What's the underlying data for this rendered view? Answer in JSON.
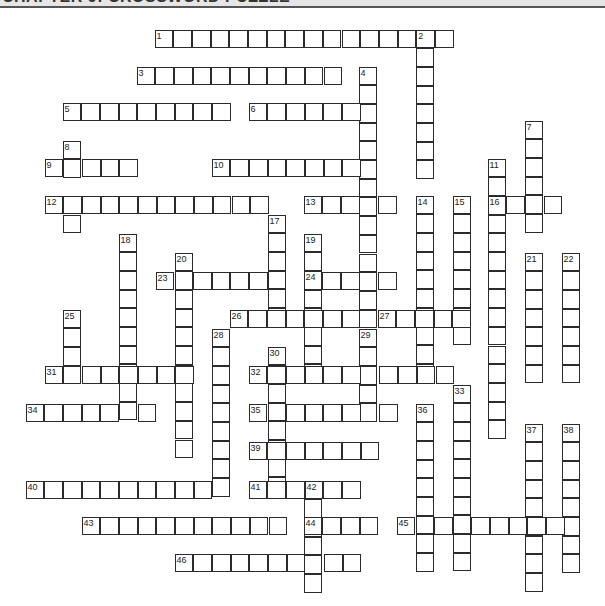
{
  "header": {
    "title": "CHAPTER 9: CROSSWORD PUZZLE"
  },
  "cell_size": 18.7,
  "words": [
    {
      "num": "1",
      "dir": "across",
      "x": 155,
      "y": 30,
      "len": 16
    },
    {
      "num": "2",
      "dir": "down",
      "x": 416,
      "y": 30,
      "len": 8
    },
    {
      "num": "3",
      "dir": "across",
      "x": 137,
      "y": 67,
      "len": 11
    },
    {
      "num": "4",
      "dir": "down",
      "x": 359,
      "y": 67,
      "len": 14
    },
    {
      "num": "5",
      "dir": "across",
      "x": 63,
      "y": 103,
      "len": 9
    },
    {
      "num": "6",
      "dir": "across",
      "x": 249,
      "y": 103,
      "len": 7
    },
    {
      "num": "7",
      "dir": "down",
      "x": 525,
      "y": 121,
      "len": 6
    },
    {
      "num": "8",
      "dir": "down",
      "x": 63,
      "y": 141,
      "len": 2
    },
    {
      "num": "9",
      "dir": "across",
      "x": 45,
      "y": 159,
      "len": 5
    },
    {
      "num": "10",
      "dir": "across",
      "x": 212,
      "y": 159,
      "len": 9
    },
    {
      "num": "11",
      "dir": "down",
      "x": 488,
      "y": 159,
      "len": 15
    },
    {
      "num": "12",
      "dir": "across",
      "x": 45,
      "y": 196,
      "len": 12
    },
    {
      "num": "",
      "dir": "down",
      "x": 63,
      "y": 215,
      "len": 1
    },
    {
      "num": "13",
      "dir": "across",
      "x": 304,
      "y": 196,
      "len": 5
    },
    {
      "num": "14",
      "dir": "down",
      "x": 416,
      "y": 196,
      "len": 10
    },
    {
      "num": "15",
      "dir": "down",
      "x": 453,
      "y": 196,
      "len": 8
    },
    {
      "num": "16",
      "dir": "across",
      "x": 488,
      "y": 196,
      "len": 4
    },
    {
      "num": "17",
      "dir": "down",
      "x": 268,
      "y": 215,
      "len": 6
    },
    {
      "num": "18",
      "dir": "down",
      "x": 119,
      "y": 234,
      "len": 10
    },
    {
      "num": "19",
      "dir": "down",
      "x": 304,
      "y": 234,
      "len": 8
    },
    {
      "num": "20",
      "dir": "down",
      "x": 175,
      "y": 253,
      "len": 11
    },
    {
      "num": "21",
      "dir": "down",
      "x": 525,
      "y": 253,
      "len": 7
    },
    {
      "num": "22",
      "dir": "down",
      "x": 562,
      "y": 253,
      "len": 7
    },
    {
      "num": "23",
      "dir": "across",
      "x": 156,
      "y": 272,
      "len": 7
    },
    {
      "num": "24",
      "dir": "across",
      "x": 304,
      "y": 272,
      "len": 5
    },
    {
      "num": "25",
      "dir": "down",
      "x": 63,
      "y": 310,
      "len": 4
    },
    {
      "num": "26",
      "dir": "across",
      "x": 230,
      "y": 310,
      "len": 7
    },
    {
      "num": "27",
      "dir": "across",
      "x": 378,
      "y": 310,
      "len": 5
    },
    {
      "num": "28",
      "dir": "down",
      "x": 212,
      "y": 329,
      "len": 9
    },
    {
      "num": "29",
      "dir": "down",
      "x": 359,
      "y": 329,
      "len": 5
    },
    {
      "num": "30",
      "dir": "down",
      "x": 268,
      "y": 347,
      "len": 8
    },
    {
      "num": "31",
      "dir": "across",
      "x": 45,
      "y": 366,
      "len": 8
    },
    {
      "num": "32",
      "dir": "across",
      "x": 249,
      "y": 366,
      "len": 11
    },
    {
      "num": "33",
      "dir": "down",
      "x": 453,
      "y": 385,
      "len": 10
    },
    {
      "num": "34",
      "dir": "across",
      "x": 26,
      "y": 404,
      "len": 7
    },
    {
      "num": "35",
      "dir": "across",
      "x": 249,
      "y": 404,
      "len": 8
    },
    {
      "num": "36",
      "dir": "down",
      "x": 416,
      "y": 404,
      "len": 9
    },
    {
      "num": "37",
      "dir": "down",
      "x": 525,
      "y": 424,
      "len": 9
    },
    {
      "num": "38",
      "dir": "down",
      "x": 562,
      "y": 424,
      "len": 8
    },
    {
      "num": "39",
      "dir": "across",
      "x": 249,
      "y": 442,
      "len": 7
    },
    {
      "num": "40",
      "dir": "across",
      "x": 26,
      "y": 481,
      "len": 11
    },
    {
      "num": "41",
      "dir": "across",
      "x": 249,
      "y": 481,
      "len": 6
    },
    {
      "num": "42",
      "dir": "down",
      "x": 304,
      "y": 481,
      "len": 6
    },
    {
      "num": "43",
      "dir": "across",
      "x": 82,
      "y": 517,
      "len": 11
    },
    {
      "num": "44",
      "dir": "across",
      "x": 304,
      "y": 517,
      "len": 4
    },
    {
      "num": "45",
      "dir": "across",
      "x": 397,
      "y": 517,
      "len": 10
    },
    {
      "num": "46",
      "dir": "across",
      "x": 175,
      "y": 554,
      "len": 10
    }
  ]
}
